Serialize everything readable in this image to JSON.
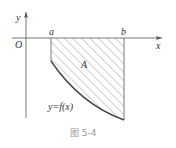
{
  "figure": {
    "caption": "图 5-4",
    "labels": {
      "y_axis": "y",
      "x_axis": "x",
      "origin": "O",
      "a": "a",
      "b": "b",
      "region": "A",
      "curve": "y=f(x)"
    },
    "colors": {
      "axis": "#555555",
      "curve": "#444444",
      "hatch": "#888888",
      "caption": "#999999"
    }
  }
}
